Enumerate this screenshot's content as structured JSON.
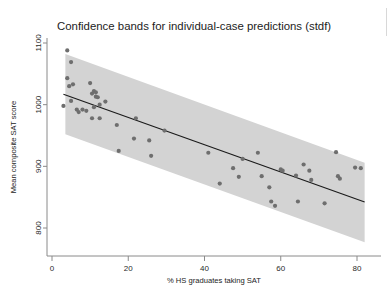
{
  "figure": {
    "title": "Confidence bands for individual-case predictions (stdf)",
    "x_axis_label": "% HS graduates taking SAT",
    "y_axis_label": "Mean composite SAT score",
    "x_ticks": [
      "0",
      "20",
      "40",
      "60",
      "80"
    ],
    "y_ticks": [
      "800",
      "900",
      "1000",
      "1100"
    ],
    "colors": {
      "band": "#d3d3d3",
      "points": "#6e6e6e",
      "fit_line": "#1a1a1a",
      "axis": "#8a8a8a",
      "background": "#ffffff",
      "text": "#1c1c1c"
    }
  },
  "chart_data": {
    "type": "scatter",
    "title": "Confidence bands for individual-case predictions (stdf)",
    "xlabel": "% HS graduates taking SAT",
    "ylabel": "Mean composite SAT score",
    "xlim": [
      0,
      84
    ],
    "ylim": [
      770,
      1115
    ],
    "xticks": [
      0,
      20,
      40,
      60,
      80
    ],
    "yticks": [
      800,
      900,
      1000,
      1100
    ],
    "grid": false,
    "legend": "none",
    "series": [
      {
        "name": "States",
        "type": "scatter",
        "marker": "filled-circle",
        "color": "#6e6e6e",
        "points": [
          [
            4.0,
            1088
          ],
          [
            5.0,
            1069
          ],
          [
            4.0,
            1043
          ],
          [
            4.5,
            1030
          ],
          [
            5.5,
            1033
          ],
          [
            3.0,
            998
          ],
          [
            5.0,
            1006
          ],
          [
            6.5,
            992
          ],
          [
            7.0,
            988
          ],
          [
            8.0,
            992
          ],
          [
            9.0,
            990
          ],
          [
            10.0,
            1035
          ],
          [
            10.5,
            1018
          ],
          [
            11.0,
            1022
          ],
          [
            11.5,
            1020
          ],
          [
            11.5,
            1013
          ],
          [
            12.0,
            1012
          ],
          [
            12.5,
            1000
          ],
          [
            11.0,
            996
          ],
          [
            10.5,
            978
          ],
          [
            12.5,
            978
          ],
          [
            14.0,
            1005
          ],
          [
            17.0,
            967
          ],
          [
            17.5,
            925
          ],
          [
            21.5,
            945
          ],
          [
            22.0,
            978
          ],
          [
            25.5,
            942
          ],
          [
            26.0,
            917
          ],
          [
            29.5,
            958
          ],
          [
            41.0,
            922
          ],
          [
            44.0,
            872
          ],
          [
            47.5,
            897
          ],
          [
            49.0,
            883
          ],
          [
            50.0,
            912
          ],
          [
            54.0,
            922
          ],
          [
            55.0,
            884
          ],
          [
            57.0,
            866
          ],
          [
            57.5,
            843
          ],
          [
            58.5,
            836
          ],
          [
            60.0,
            895
          ],
          [
            60.5,
            893
          ],
          [
            64.0,
            885
          ],
          [
            64.5,
            843
          ],
          [
            66.0,
            903
          ],
          [
            67.5,
            893
          ],
          [
            68.0,
            878
          ],
          [
            71.5,
            840
          ],
          [
            74.5,
            923
          ],
          [
            75.0,
            884
          ],
          [
            75.5,
            880
          ],
          [
            79.5,
            898
          ],
          [
            81.0,
            897
          ]
        ]
      },
      {
        "name": "Fitted line",
        "type": "line",
        "color": "#1a1a1a",
        "points": [
          [
            3.0,
            1017
          ],
          [
            82.0,
            842
          ]
        ]
      },
      {
        "name": "Individual-case prediction band (stdf)",
        "type": "band",
        "color": "#d3d3d3",
        "upper": [
          [
            3.5,
            1082
          ],
          [
            82.0,
            906
          ]
        ],
        "lower": [
          [
            3.5,
            952
          ],
          [
            82.0,
            777
          ]
        ]
      }
    ]
  }
}
